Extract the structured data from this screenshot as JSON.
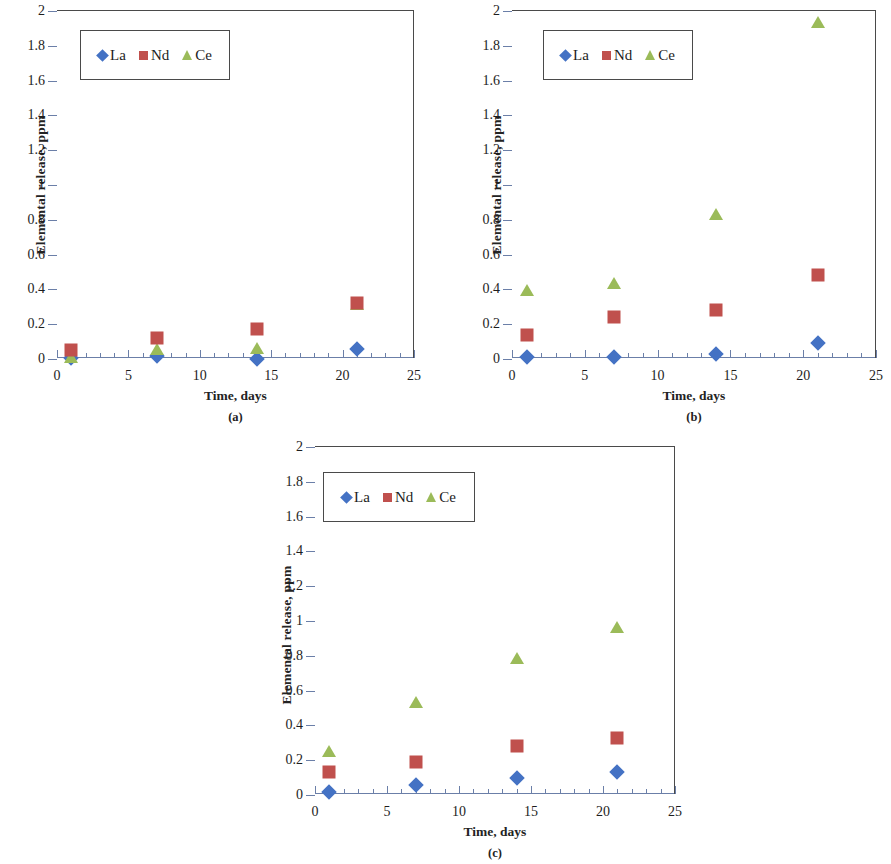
{
  "figure": {
    "series_colors": {
      "La": "#4472c4",
      "Nd": "#c0504d",
      "Ce": "#9bbb59"
    },
    "axis_color": "#6b7fa8",
    "frame_color": "#4a4a4a"
  },
  "legend": {
    "entries": [
      {
        "label": "La",
        "marker": "diamond-marker",
        "color": "#4472c4"
      },
      {
        "label": "Nd",
        "marker": "square-marker",
        "color": "#c0504d"
      },
      {
        "label": "Ce",
        "marker": "triangle-marker",
        "color": "#9bbb59"
      }
    ]
  },
  "axes": {
    "y_ticks": [
      "0",
      "0.2",
      "0.4",
      "0.6",
      "0.8",
      "1",
      "1.2",
      "1.4",
      "1.6",
      "1.8",
      "2"
    ],
    "x_ticks": [
      "0",
      "5",
      "10",
      "15",
      "20",
      "25"
    ],
    "ylabel": "Elemental release, ppm",
    "xlabel": "Time, days"
  },
  "panels": [
    {
      "id": "a",
      "caption": "(a)"
    },
    {
      "id": "b",
      "caption": "(b)"
    },
    {
      "id": "c",
      "caption": "(c)"
    }
  ],
  "chart_data": [
    {
      "type": "scatter",
      "panel": "(a)",
      "title": "",
      "xlabel": "Time, days",
      "ylabel": "Elemental release, ppm",
      "xlim": [
        0,
        25
      ],
      "ylim": [
        0,
        2
      ],
      "xticks": [
        0,
        5,
        10,
        15,
        20,
        25
      ],
      "yticks": [
        0,
        0.2,
        0.4,
        0.6,
        0.8,
        1,
        1.2,
        1.4,
        1.6,
        1.8,
        2
      ],
      "x": [
        1,
        7,
        14,
        21
      ],
      "grid": false,
      "legend_position": "upper-left",
      "series": [
        {
          "name": "La",
          "marker": "diamond",
          "color": "#4472c4",
          "values": [
            0.005,
            0.02,
            0.0,
            0.06
          ]
        },
        {
          "name": "Nd",
          "marker": "square",
          "color": "#c0504d",
          "values": [
            0.05,
            0.12,
            0.17,
            0.32
          ]
        },
        {
          "name": "Ce",
          "marker": "triangle",
          "color": "#9bbb59",
          "values": [
            0.005,
            0.05,
            0.06,
            0.31
          ]
        }
      ]
    },
    {
      "type": "scatter",
      "panel": "(b)",
      "title": "",
      "xlabel": "Time, days",
      "ylabel": "Elemental release, ppm",
      "xlim": [
        0,
        25
      ],
      "ylim": [
        0,
        2
      ],
      "xticks": [
        0,
        5,
        10,
        15,
        20,
        25
      ],
      "yticks": [
        0,
        0.2,
        0.4,
        0.6,
        0.8,
        1,
        1.2,
        1.4,
        1.6,
        1.8,
        2
      ],
      "x": [
        1,
        7,
        14,
        21
      ],
      "grid": false,
      "legend_position": "upper-left",
      "series": [
        {
          "name": "La",
          "marker": "diamond",
          "color": "#4472c4",
          "values": [
            0.01,
            0.01,
            0.03,
            0.09
          ]
        },
        {
          "name": "Nd",
          "marker": "square",
          "color": "#c0504d",
          "values": [
            0.14,
            0.24,
            0.28,
            0.48
          ]
        },
        {
          "name": "Ce",
          "marker": "triangle",
          "color": "#9bbb59",
          "values": [
            0.39,
            0.43,
            0.83,
            1.93
          ]
        }
      ]
    },
    {
      "type": "scatter",
      "panel": "(c)",
      "title": "",
      "xlabel": "Time, days",
      "ylabel": "Elemental release, ppm",
      "xlim": [
        0,
        25
      ],
      "ylim": [
        0,
        2
      ],
      "xticks": [
        0,
        5,
        10,
        15,
        20,
        25
      ],
      "yticks": [
        0,
        0.2,
        0.4,
        0.6,
        0.8,
        1,
        1.2,
        1.4,
        1.6,
        1.8,
        2
      ],
      "x": [
        1,
        7,
        14,
        21
      ],
      "grid": false,
      "legend_position": "upper-left",
      "series": [
        {
          "name": "La",
          "marker": "diamond",
          "color": "#4472c4",
          "values": [
            0.015,
            0.06,
            0.1,
            0.13
          ]
        },
        {
          "name": "Nd",
          "marker": "square",
          "color": "#c0504d",
          "values": [
            0.13,
            0.19,
            0.28,
            0.33
          ]
        },
        {
          "name": "Ce",
          "marker": "triangle",
          "color": "#9bbb59",
          "values": [
            0.25,
            0.53,
            0.78,
            0.96
          ]
        }
      ]
    }
  ]
}
